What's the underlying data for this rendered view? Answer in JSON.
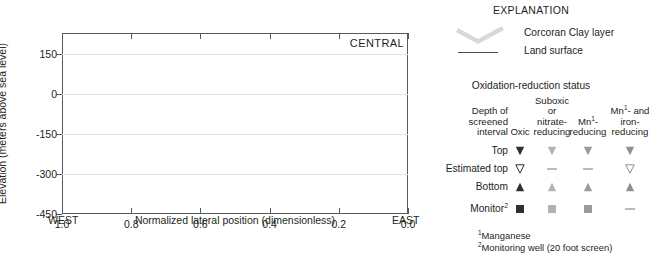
{
  "chart_data": {
    "type": "scatter",
    "title": "",
    "panel_label": "CENTRAL",
    "xlabel": "Normalized lateral position (dimensionless)",
    "ylabel": "Elevation (meters above sea level)",
    "xlim": [
      1.0,
      0.0
    ],
    "ylim": [
      -450,
      230
    ],
    "x_ticks": [
      1.0,
      0.8,
      0.6,
      0.4,
      0.2,
      0.0
    ],
    "x_tick_labels": [
      "1.0",
      "0.8",
      "0.6",
      "0.4",
      "0.2",
      "0.0"
    ],
    "y_ticks": [
      150,
      0,
      -150,
      -300,
      -450
    ],
    "y_tick_labels": [
      "150",
      "0",
      "-150",
      "-300",
      "-450"
    ],
    "x_direction_left": "WEST",
    "x_direction_right": "EAST",
    "grid": true,
    "x_axis_reversed": true,
    "series": [
      {
        "name": "Land surface",
        "type": "line",
        "color": "#4d4d4f",
        "points": [
          [
            0.935,
            100
          ],
          [
            0.925,
            45
          ],
          [
            0.918,
            52
          ],
          [
            0.9,
            55
          ],
          [
            0.872,
            54
          ],
          [
            0.84,
            50
          ],
          [
            0.812,
            47
          ],
          [
            0.784,
            49
          ],
          [
            0.752,
            62
          ],
          [
            0.728,
            70
          ],
          [
            0.7,
            55
          ],
          [
            0.676,
            41
          ],
          [
            0.652,
            52
          ],
          [
            0.628,
            55
          ],
          [
            0.6,
            42
          ],
          [
            0.572,
            35
          ],
          [
            0.54,
            43
          ],
          [
            0.508,
            41
          ],
          [
            0.476,
            34
          ],
          [
            0.444,
            30
          ],
          [
            0.412,
            33
          ],
          [
            0.384,
            41
          ],
          [
            0.356,
            32
          ],
          [
            0.324,
            28
          ],
          [
            0.296,
            42
          ],
          [
            0.268,
            47
          ],
          [
            0.24,
            40
          ],
          [
            0.208,
            33
          ],
          [
            0.176,
            32
          ],
          [
            0.144,
            34
          ],
          [
            0.112,
            35
          ],
          [
            0.08,
            33
          ],
          [
            0.048,
            30
          ],
          [
            0.016,
            28
          ],
          [
            0.0,
            28
          ]
        ]
      },
      {
        "name": "Corcoran Clay layer",
        "type": "band",
        "color": "#d8d8d8",
        "top_points": [
          [
            0.94,
            -22
          ],
          [
            0.91,
            -28
          ],
          [
            0.88,
            -34
          ],
          [
            0.85,
            -40
          ],
          [
            0.82,
            -45
          ],
          [
            0.79,
            -50
          ],
          [
            0.76,
            -54
          ],
          [
            0.73,
            -56
          ],
          [
            0.7,
            -58
          ],
          [
            0.67,
            -60
          ],
          [
            0.64,
            -63
          ],
          [
            0.61,
            -66
          ],
          [
            0.592,
            -80
          ],
          [
            0.575,
            -66
          ],
          [
            0.55,
            -64
          ],
          [
            0.52,
            -66
          ],
          [
            0.49,
            -70
          ],
          [
            0.46,
            -72
          ],
          [
            0.43,
            -70
          ],
          [
            0.4,
            -68
          ],
          [
            0.37,
            -66
          ],
          [
            0.34,
            -62
          ],
          [
            0.31,
            -60
          ],
          [
            0.28,
            -62
          ],
          [
            0.25,
            -66
          ],
          [
            0.22,
            -70
          ],
          [
            0.19,
            -72
          ],
          [
            0.16,
            -70
          ],
          [
            0.13,
            -62
          ],
          [
            0.1,
            -52
          ],
          [
            0.07,
            -46
          ],
          [
            0.04,
            -48
          ],
          [
            0.01,
            -52
          ],
          [
            0.0,
            -54
          ]
        ],
        "thickness": 14
      },
      {
        "name": "Well symbols",
        "type": "markers",
        "wells": [
          {
            "x": 0.938,
            "kind": "estimated-top",
            "status": "mn-iron",
            "y": 0
          },
          {
            "x": 0.938,
            "kind": "bottom",
            "status": "mn-iron",
            "y": -52
          },
          {
            "x": 0.92,
            "kind": "monitor",
            "status": "oxic",
            "y": 5
          },
          {
            "x": 0.92,
            "kind": "monitor",
            "status": "oxic",
            "y": -42
          },
          {
            "x": 0.92,
            "kind": "top",
            "status": "oxic",
            "y": 3
          },
          {
            "x": 0.818,
            "kind": "top",
            "status": "mn-iron",
            "y": -68
          },
          {
            "x": 0.818,
            "kind": "bottom",
            "status": "mn-iron",
            "y": -110
          },
          {
            "x": 0.722,
            "kind": "top",
            "status": "mn-iron",
            "y": -18
          },
          {
            "x": 0.722,
            "kind": "bottom",
            "status": "mn-iron",
            "y": -45
          },
          {
            "x": 0.648,
            "kind": "top",
            "status": "oxic",
            "y": -22
          },
          {
            "x": 0.648,
            "kind": "bottom",
            "status": "oxic",
            "y": -56
          },
          {
            "x": 0.592,
            "kind": "monitor",
            "status": "suboxic",
            "y": -18
          },
          {
            "x": 0.592,
            "kind": "monitor",
            "status": "suboxic",
            "y": -72
          },
          {
            "x": 0.592,
            "kind": "monitor",
            "status": "suboxic",
            "y": -118
          },
          {
            "x": 0.56,
            "kind": "top",
            "status": "mn-iron",
            "y": -62
          },
          {
            "x": 0.56,
            "kind": "bottom",
            "status": "mn-iron",
            "y": -86
          },
          {
            "x": 0.512,
            "kind": "top",
            "status": "oxic",
            "y": -16
          },
          {
            "x": 0.512,
            "kind": "bottom",
            "status": "oxic",
            "y": -34
          },
          {
            "x": 0.498,
            "kind": "top",
            "status": "mn",
            "y": -16
          },
          {
            "x": 0.498,
            "kind": "bottom",
            "status": "mn",
            "y": -34
          },
          {
            "x": 0.4,
            "kind": "top",
            "status": "mn-iron",
            "y": -70
          },
          {
            "x": 0.4,
            "kind": "bottom",
            "status": "mn-iron",
            "y": -142
          },
          {
            "x": 0.348,
            "kind": "top",
            "status": "oxic",
            "y": -44
          },
          {
            "x": 0.348,
            "kind": "bottom",
            "status": "oxic",
            "y": -64
          },
          {
            "x": 0.272,
            "kind": "monitor",
            "status": "suboxic",
            "y": -10
          },
          {
            "x": 0.196,
            "kind": "top",
            "status": "oxic",
            "y": -6
          },
          {
            "x": 0.196,
            "kind": "bottom",
            "status": "oxic",
            "y": -22
          },
          {
            "x": 0.178,
            "kind": "top",
            "status": "oxic",
            "y": -6
          },
          {
            "x": 0.178,
            "kind": "bottom",
            "status": "oxic",
            "y": -22
          },
          {
            "x": 0.164,
            "kind": "top",
            "status": "mn",
            "y": -6
          },
          {
            "x": 0.164,
            "kind": "bottom",
            "status": "mn",
            "y": -22
          },
          {
            "x": 0.098,
            "kind": "top",
            "status": "oxic",
            "y": 2
          },
          {
            "x": 0.098,
            "kind": "bottom",
            "status": "oxic",
            "y": -26
          },
          {
            "x": 0.082,
            "kind": "monitor",
            "status": "suboxic",
            "y": 18
          },
          {
            "x": 0.082,
            "kind": "monitor",
            "status": "suboxic",
            "y": -48
          },
          {
            "x": 0.082,
            "kind": "monitor",
            "status": "suboxic",
            "y": -96
          },
          {
            "x": 0.072,
            "kind": "top",
            "status": "oxic",
            "y": 2
          },
          {
            "x": 0.072,
            "kind": "bottom",
            "status": "oxic",
            "y": -26
          },
          {
            "x": 0.012,
            "kind": "top",
            "status": "mn",
            "y": -8
          },
          {
            "x": 0.012,
            "kind": "bottom",
            "status": "mn",
            "y": -26
          }
        ]
      }
    ]
  },
  "explanation": {
    "title": "EXPLANATION",
    "clay_label": "Corcoran Clay layer",
    "land_label": "Land surface",
    "redox_title": "Oxidation-reduction status",
    "columns": [
      {
        "key": "depth",
        "lines": [
          "Depth of",
          "screened",
          "interval"
        ]
      },
      {
        "key": "oxic",
        "lines": [
          "Oxic"
        ]
      },
      {
        "key": "suboxic",
        "lines": [
          "Suboxic",
          "or",
          "nitrate-",
          "reducing"
        ]
      },
      {
        "key": "mn",
        "lines": [
          "Mn",
          "reducing"
        ],
        "sup": "1"
      },
      {
        "key": "mn-iron",
        "lines": [
          "Mn",
          "- and",
          "iron-",
          "reducing"
        ],
        "sup": "1"
      }
    ],
    "col_headers_plain": {
      "depth": "Depth of screened interval",
      "oxic": "Oxic",
      "suboxic": "Suboxic or nitrate-reducing",
      "mn": "Mn1-reducing",
      "mn_iron": "Mn1- and iron-reducing"
    },
    "rows": [
      {
        "label": "Top",
        "symbol": "down-triangle-filled",
        "cells": [
          "down-triangle-filled",
          "down-triangle-filled",
          "down-triangle-filled",
          "down-triangle-filled"
        ]
      },
      {
        "label": "Estimated top",
        "symbol": "down-triangle-open",
        "cells": [
          "down-triangle-open",
          "dash",
          "dash",
          "down-triangle-open"
        ]
      },
      {
        "label": "Bottom",
        "symbol": "up-triangle-filled",
        "cells": [
          "up-triangle-filled",
          "up-triangle-filled",
          "up-triangle-filled",
          "up-triangle-filled"
        ]
      },
      {
        "label": "Monitor",
        "label_sup": "2",
        "symbol": "square-filled",
        "cells": [
          "square-filled",
          "square-filled",
          "square-filled",
          "dash"
        ]
      }
    ],
    "footnotes": [
      {
        "sup": "1",
        "text": "Manganese"
      },
      {
        "sup": "2",
        "text": "Monitoring well (20 foot screen)"
      }
    ]
  },
  "colors": {
    "oxic": "#2f2f30",
    "suboxic": "#b3b3b3",
    "mn": "#999b9d",
    "mn_iron": "#8d8f91",
    "clay": "#d8d8d8",
    "land_surface": "#4d4d4f",
    "axis": "#58595b",
    "grid": "#e3e3e3",
    "text": "#231f20"
  }
}
